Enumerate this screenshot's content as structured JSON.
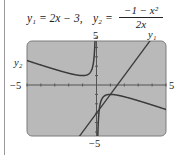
{
  "header": {
    "eq1": "y₁ = 2x − 3,",
    "eq2_lhs": "y₂ =",
    "eq2_num": "−1 − x²",
    "eq2_den": "2x"
  },
  "labels": {
    "ymax": "5",
    "ymin": "−5",
    "xmin": "−5",
    "xmax": "5",
    "y1": "y₁",
    "y2": "y₂"
  },
  "colors": {
    "screen": "#b9b9b9",
    "screen_border": "#7d7d7d",
    "curve": "#3a3a3a",
    "axis": "#555555"
  },
  "chart_data": {
    "type": "line",
    "xlabel": "",
    "ylabel": "",
    "xlim": [
      -5,
      5
    ],
    "ylim": [
      -5,
      5
    ],
    "grid": false,
    "tick_marks": "integer ticks on both axes",
    "series": [
      {
        "name": "y1",
        "expression": "2x - 3",
        "x": [
          -5,
          -1,
          0,
          1,
          1.5,
          2,
          3,
          3.85
        ],
        "values": [
          -13,
          -5,
          -3,
          -1,
          0,
          1,
          3,
          4.7
        ]
      },
      {
        "name": "y2",
        "expression": "(-1 - x^2)/(2x)",
        "x": [
          -5,
          -4,
          -3,
          -2,
          -1,
          -0.5,
          -0.2,
          0.2,
          0.5,
          1,
          2,
          3,
          4,
          5
        ],
        "values": [
          2.6,
          2.125,
          1.667,
          1.25,
          1.0,
          1.25,
          2.6,
          -2.6,
          -1.25,
          -1.0,
          -1.25,
          -1.667,
          -2.125,
          -2.6
        ]
      }
    ],
    "asymptote": "x = 0 (vertical), y = -x/2 (oblique)",
    "annotations": [
      "y1 labels the line",
      "y2 labels the hyperbola-like curve"
    ]
  }
}
